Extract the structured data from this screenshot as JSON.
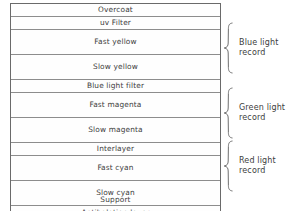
{
  "diagram": {
    "support_label": "Support",
    "layers": [
      {
        "name": "Overcoat",
        "thickness": "thin"
      },
      {
        "name": "uv Filter",
        "thickness": "thin"
      },
      {
        "name": "Fast yellow",
        "thickness": "thick"
      },
      {
        "name": "Slow yellow",
        "thickness": "thick"
      },
      {
        "name": "Blue light filter",
        "thickness": "thin"
      },
      {
        "name": "Fast magenta",
        "thickness": "thick"
      },
      {
        "name": "Slow magenta",
        "thickness": "thick"
      },
      {
        "name": "Interlayer",
        "thickness": "thin"
      },
      {
        "name": "Fast cyan",
        "thickness": "thick"
      },
      {
        "name": "Slow cyan",
        "thickness": "thick"
      },
      {
        "name": "Antihalation layer",
        "thickness": "thin"
      }
    ],
    "groups": [
      {
        "label": "Blue light\nrecord",
        "icon": "curly-brace-icon"
      },
      {
        "label": "Green light\nrecord",
        "icon": "curly-brace-icon"
      },
      {
        "label": "Red light\nrecord",
        "icon": "curly-brace-icon"
      }
    ],
    "colors": {
      "outer_border": "#6a6a6a",
      "divider": "#8d8d8d",
      "text": "#3d3d3d",
      "background": "#ffffff"
    }
  }
}
